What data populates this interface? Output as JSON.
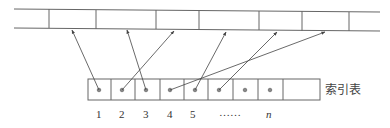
{
  "diagram": {
    "type": "index-table-pointer-diagram",
    "index_table_label": "索引表",
    "index_labels": [
      "1",
      "2",
      "3",
      "4",
      "5",
      "……",
      "n"
    ],
    "colors": {
      "line": "#555555",
      "dot": "#777777",
      "text": "#333333"
    },
    "main_strip": {
      "cell_count": 8,
      "dividers_x": [
        49,
        96,
        156,
        199,
        259,
        302,
        349
      ]
    },
    "index_cells": 8,
    "pointers": [
      {
        "from_index": 1,
        "to_strip_cell": 2
      },
      {
        "from_index": 2,
        "to_strip_cell": 4
      },
      {
        "from_index": 3,
        "to_strip_cell": 3
      },
      {
        "from_index": 4,
        "to_strip_cell": 7
      },
      {
        "from_index": 5,
        "to_strip_cell": 5
      },
      {
        "from_index": 6,
        "to_strip_cell": 6
      }
    ]
  }
}
